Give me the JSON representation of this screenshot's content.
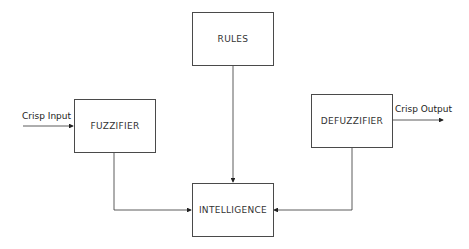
{
  "diagram": {
    "type": "block-diagram",
    "title": "",
    "nodes": [
      {
        "id": "rules",
        "label": "RULES"
      },
      {
        "id": "fuzzifier",
        "label": "FUZZIFIER"
      },
      {
        "id": "defuzzifier",
        "label": "DEFUZZIFIER"
      },
      {
        "id": "intelligence",
        "label": "INTELLIGENCE"
      }
    ],
    "edges": [
      {
        "from": "input",
        "to": "fuzzifier",
        "label": "Crisp Input"
      },
      {
        "from": "fuzzifier",
        "to": "intelligence",
        "label": ""
      },
      {
        "from": "rules",
        "to": "intelligence",
        "label": ""
      },
      {
        "from": "defuzzifier",
        "to": "intelligence",
        "label": ""
      },
      {
        "from": "defuzzifier",
        "to": "output",
        "label": "Crisp Output"
      }
    ],
    "labels": {
      "crisp_input": "Crisp Input",
      "crisp_output": "Crisp Output"
    },
    "colors": {
      "line": "#333333",
      "box_border": "#4a4a4a",
      "text": "#333333",
      "background": "#ffffff"
    }
  }
}
